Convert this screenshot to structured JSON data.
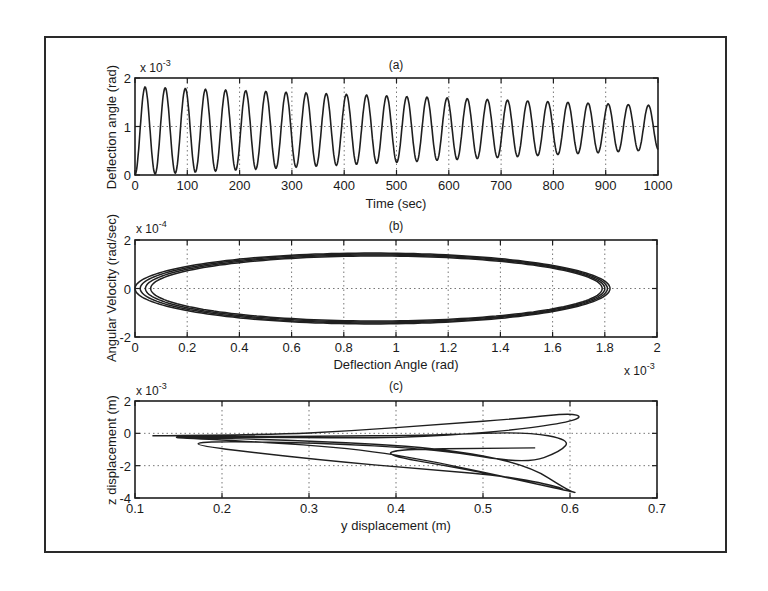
{
  "chart_data": [
    {
      "type": "line",
      "panel": "(a)",
      "title": "(a)",
      "xlabel": "Time (sec)",
      "ylabel": "Deflection angle (rad)",
      "y_multiplier": "x 10^-3",
      "xlim": [
        0,
        1000
      ],
      "ylim": [
        0,
        2
      ],
      "xticks": [
        0,
        100,
        200,
        300,
        400,
        500,
        600,
        700,
        800,
        900,
        1000
      ],
      "yticks": [
        0,
        1,
        2
      ],
      "grid": "dotted",
      "description": "Damped sinusoid, ~26 cycles, period ~38.5 s; starts at 0, peaks decay from ~1.82e-3 to ~1.43e-3, troughs rise from ~0 to ~0.52e-3",
      "series": [
        {
          "name": "deflection",
          "period": 38.5,
          "start_value": 0,
          "peak_start": 1.82,
          "peak_end": 1.43,
          "trough_start": 0.0,
          "trough_end": 0.52
        }
      ]
    },
    {
      "type": "line",
      "panel": "(b)",
      "title": "(b)",
      "xlabel": "Deflection Angle (rad)",
      "ylabel": "Angular Velocity (rad/sec)",
      "x_multiplier": "x 10^-3",
      "y_multiplier": "x 10^-4",
      "xlim": [
        0,
        2
      ],
      "ylim": [
        -2,
        2
      ],
      "xticks": [
        0,
        0.2,
        0.4,
        0.6,
        0.8,
        1,
        1.2,
        1.4,
        1.6,
        1.8,
        2
      ],
      "yticks": [
        -2,
        0,
        2
      ],
      "grid": "dotted",
      "description": "Phase portrait: nested closed ellipses centered near (0.91, 0), x from ~0.0 to ~1.82, y from ~-1.45 to ~1.45",
      "series": [
        {
          "name": "orbit1",
          "center_x": 0.91,
          "x_half": 0.91,
          "y_half": 1.46
        },
        {
          "name": "orbit2",
          "center_x": 0.915,
          "x_half": 0.895,
          "y_half": 1.42
        },
        {
          "name": "orbit3",
          "center_x": 0.92,
          "x_half": 0.88,
          "y_half": 1.38
        },
        {
          "name": "orbit4",
          "center_x": 0.925,
          "x_half": 0.865,
          "y_half": 1.34
        }
      ]
    },
    {
      "type": "line",
      "panel": "(c)",
      "title": "(c)",
      "xlabel": "y displacement (m)",
      "ylabel": "z displacement (m)",
      "y_multiplier": "x 10^-3",
      "xlim": [
        0.1,
        0.7
      ],
      "ylim": [
        -4,
        2
      ],
      "xticks": [
        0.1,
        0.2,
        0.3,
        0.4,
        0.5,
        0.6,
        0.7
      ],
      "yticks": [
        -4,
        -2,
        0,
        2
      ],
      "grid": "dotted",
      "description": "Trajectory in y-z plane: lobes extending from y~0.12 out to y~0.61, z between ~-3.7e-3 and ~1.3e-3",
      "series": [
        {
          "name": "path",
          "points": [
            [
              0.12,
              -0.15
            ],
            [
              0.25,
              -0.1
            ],
            [
              0.35,
              0.15
            ],
            [
              0.45,
              0.55
            ],
            [
              0.55,
              0.95
            ],
            [
              0.6,
              1.25
            ],
            [
              0.615,
              1.0
            ],
            [
              0.59,
              0.6
            ],
            [
              0.52,
              0.1
            ],
            [
              0.4,
              -0.3
            ],
            [
              0.25,
              -0.25
            ],
            [
              0.12,
              -0.2
            ],
            [
              0.3,
              -0.45
            ],
            [
              0.45,
              -0.9
            ],
            [
              0.55,
              -1.9
            ],
            [
              0.6,
              -3.6
            ],
            [
              0.61,
              -3.7
            ],
            [
              0.55,
              -3.0
            ],
            [
              0.45,
              -1.8
            ],
            [
              0.35,
              -0.9
            ],
            [
              0.2,
              -0.4
            ],
            [
              0.12,
              -0.2
            ],
            [
              0.3,
              -0.2
            ],
            [
              0.45,
              -0.1
            ],
            [
              0.55,
              0.1
            ],
            [
              0.6,
              -0.4
            ],
            [
              0.59,
              -1.1
            ],
            [
              0.55,
              -1.9
            ],
            [
              0.45,
              -1.0
            ],
            [
              0.3,
              -0.55
            ],
            [
              0.13,
              -0.5
            ],
            [
              0.3,
              -1.6
            ],
            [
              0.45,
              -2.3
            ],
            [
              0.52,
              -2.6
            ],
            [
              0.58,
              -3.2
            ],
            [
              0.6,
              -3.6
            ],
            [
              0.5,
              -2.4
            ],
            [
              0.35,
              -1.0
            ],
            [
              0.56,
              -0.9
            ]
          ]
        }
      ]
    }
  ]
}
